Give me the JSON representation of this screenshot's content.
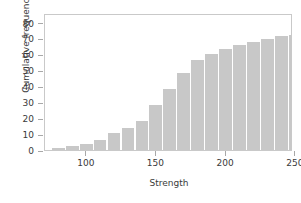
{
  "chart_data": {
    "type": "bar",
    "title": "",
    "subtitle": "",
    "xlabel": "Strength",
    "ylabel": "Cumulative frequency",
    "xlim": [
      70,
      248
    ],
    "ylim": [
      0,
      86
    ],
    "xticks": [
      100,
      150,
      200,
      250
    ],
    "yticks": [
      0,
      10,
      20,
      30,
      40,
      50,
      60,
      70,
      80
    ],
    "grid": false,
    "legend": null,
    "bar_color": "#c8c8c8",
    "bin_width": 10,
    "bin_starts": [
      75,
      85,
      95,
      105,
      115,
      125,
      135,
      145,
      155,
      165,
      175,
      185,
      195,
      205,
      215,
      225,
      235,
      245
    ],
    "categories": [
      "75-85",
      "85-95",
      "95-105",
      "105-115",
      "115-125",
      "125-135",
      "135-145",
      "145-155",
      "155-165",
      "165-175",
      "175-185",
      "185-195",
      "195-205",
      "205-215",
      "215-225",
      "225-235",
      "235-245",
      "245-255"
    ],
    "values": [
      1,
      2,
      3,
      4,
      7,
      9,
      11,
      17,
      23,
      29,
      34,
      36,
      38,
      39,
      40,
      41,
      42,
      43
    ],
    "cumulative_values": [
      1,
      2,
      3,
      4,
      7,
      9,
      11,
      17,
      23,
      29,
      34,
      36,
      38,
      39,
      40,
      41,
      42,
      43
    ],
    "bar_heights": [
      1.5,
      2.5,
      4.0,
      6.0,
      10.5,
      14.0,
      18.5,
      28.5,
      38.5,
      48.5,
      56.5,
      60.0,
      63.5,
      66.0,
      68.0,
      70.0,
      71.5,
      72.0
    ]
  }
}
